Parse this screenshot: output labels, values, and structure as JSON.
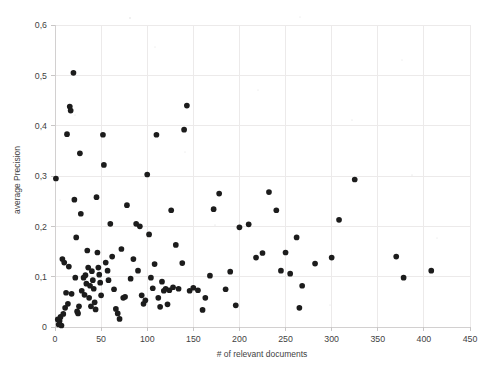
{
  "chart_data": {
    "type": "scatter",
    "title": "",
    "xlabel": "# of relevant documents",
    "ylabel": "average Precision",
    "xlim": [
      0,
      450
    ],
    "ylim": [
      0,
      0.6
    ],
    "grid": true,
    "legend": "none",
    "decimal_separator": ",",
    "xticks": [
      "0",
      "50",
      "100",
      "150",
      "200",
      "250",
      "300",
      "350",
      "400",
      "450"
    ],
    "xtick_values": [
      0,
      50,
      100,
      150,
      200,
      250,
      300,
      350,
      400,
      450
    ],
    "yticks": [
      "0",
      "0,1",
      "0,2",
      "0,3",
      "0,4",
      "0,5",
      "0,6"
    ],
    "ytick_values": [
      0,
      0.1,
      0.2,
      0.3,
      0.4,
      0.5,
      0.6
    ],
    "marker": {
      "shape": "circle",
      "color": "#1c1c1c",
      "size": 3
    },
    "point_count": 118,
    "points": [
      [
        1,
        0.295
      ],
      [
        3,
        0.015
      ],
      [
        4,
        0.005
      ],
      [
        5,
        0.012
      ],
      [
        6,
        0.02
      ],
      [
        7,
        0.003
      ],
      [
        8,
        0.135
      ],
      [
        9,
        0.026
      ],
      [
        10,
        0.128
      ],
      [
        11,
        0.038
      ],
      [
        12,
        0.068
      ],
      [
        13,
        0.383
      ],
      [
        14,
        0.046
      ],
      [
        15,
        0.12
      ],
      [
        16,
        0.438
      ],
      [
        17,
        0.43
      ],
      [
        18,
        0.066
      ],
      [
        20,
        0.505
      ],
      [
        21,
        0.253
      ],
      [
        22,
        0.098
      ],
      [
        23,
        0.178
      ],
      [
        24,
        0.031
      ],
      [
        25,
        0.027
      ],
      [
        26,
        0.041
      ],
      [
        27,
        0.345
      ],
      [
        28,
        0.225
      ],
      [
        29,
        0.072
      ],
      [
        31,
        0.098
      ],
      [
        32,
        0.064
      ],
      [
        33,
        0.103
      ],
      [
        34,
        0.086
      ],
      [
        35,
        0.152
      ],
      [
        36,
        0.118
      ],
      [
        37,
        0.058
      ],
      [
        38,
        0.082
      ],
      [
        39,
        0.041
      ],
      [
        40,
        0.111
      ],
      [
        41,
        0.093
      ],
      [
        42,
        0.076
      ],
      [
        43,
        0.049
      ],
      [
        44,
        0.035
      ],
      [
        45,
        0.258
      ],
      [
        46,
        0.148
      ],
      [
        47,
        0.118
      ],
      [
        48,
        0.104
      ],
      [
        49,
        0.088
      ],
      [
        50,
        0.063
      ],
      [
        52,
        0.382
      ],
      [
        53,
        0.322
      ],
      [
        55,
        0.128
      ],
      [
        57,
        0.112
      ],
      [
        58,
        0.093
      ],
      [
        60,
        0.205
      ],
      [
        62,
        0.14
      ],
      [
        64,
        0.075
      ],
      [
        66,
        0.036
      ],
      [
        68,
        0.027
      ],
      [
        70,
        0.016
      ],
      [
        72,
        0.155
      ],
      [
        74,
        0.058
      ],
      [
        76,
        0.06
      ],
      [
        78,
        0.242
      ],
      [
        82,
        0.096
      ],
      [
        85,
        0.135
      ],
      [
        88,
        0.205
      ],
      [
        90,
        0.112
      ],
      [
        92,
        0.2
      ],
      [
        94,
        0.063
      ],
      [
        96,
        0.046
      ],
      [
        98,
        0.053
      ],
      [
        100,
        0.303
      ],
      [
        102,
        0.184
      ],
      [
        104,
        0.098
      ],
      [
        106,
        0.077
      ],
      [
        108,
        0.125
      ],
      [
        110,
        0.382
      ],
      [
        112,
        0.058
      ],
      [
        114,
        0.04
      ],
      [
        116,
        0.09
      ],
      [
        118,
        0.072
      ],
      [
        120,
        0.076
      ],
      [
        122,
        0.045
      ],
      [
        124,
        0.073
      ],
      [
        126,
        0.232
      ],
      [
        128,
        0.079
      ],
      [
        131,
        0.163
      ],
      [
        134,
        0.076
      ],
      [
        138,
        0.127
      ],
      [
        140,
        0.392
      ],
      [
        143,
        0.44
      ],
      [
        146,
        0.072
      ],
      [
        150,
        0.078
      ],
      [
        155,
        0.073
      ],
      [
        160,
        0.034
      ],
      [
        163,
        0.058
      ],
      [
        168,
        0.102
      ],
      [
        172,
        0.234
      ],
      [
        178,
        0.265
      ],
      [
        185,
        0.075
      ],
      [
        190,
        0.11
      ],
      [
        196,
        0.043
      ],
      [
        200,
        0.198
      ],
      [
        210,
        0.204
      ],
      [
        218,
        0.138
      ],
      [
        225,
        0.147
      ],
      [
        232,
        0.268
      ],
      [
        240,
        0.232
      ],
      [
        245,
        0.112
      ],
      [
        250,
        0.148
      ],
      [
        255,
        0.106
      ],
      [
        262,
        0.178
      ],
      [
        265,
        0.038
      ],
      [
        268,
        0.082
      ],
      [
        282,
        0.126
      ],
      [
        300,
        0.138
      ],
      [
        308,
        0.213
      ],
      [
        325,
        0.293
      ],
      [
        370,
        0.14
      ],
      [
        378,
        0.098
      ],
      [
        408,
        0.112
      ]
    ]
  }
}
